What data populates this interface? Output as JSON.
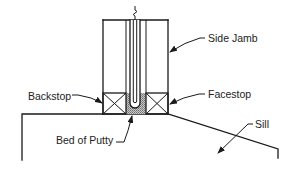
{
  "diagram": {
    "labels": {
      "side_jamb": "Side Jamb",
      "backstop": "Backstop",
      "facestop": "Facestop",
      "bed_of_putty": "Bed of Putty",
      "sill": "Sill"
    },
    "colors": {
      "line": "#1a1a1a",
      "putty_fill": "#9a9a9a",
      "background": "#ffffff"
    }
  }
}
